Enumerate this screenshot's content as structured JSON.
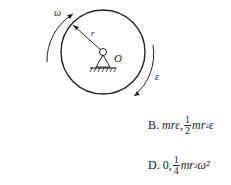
{
  "diagram": {
    "labels": {
      "omega": "ω",
      "radius": "r",
      "center": "O",
      "epsilon": "ε"
    }
  },
  "options": [
    {
      "letter": "B.",
      "first": "mrε",
      "sep": ",",
      "num": "1",
      "den": "2",
      "second": "mr",
      "exp": "2",
      "tail": "ε"
    },
    {
      "letter": "D.",
      "first": "0",
      "sep": ",",
      "num": "1",
      "den": "4",
      "second": "mr",
      "exp": "2",
      "tail": "ω²"
    }
  ]
}
